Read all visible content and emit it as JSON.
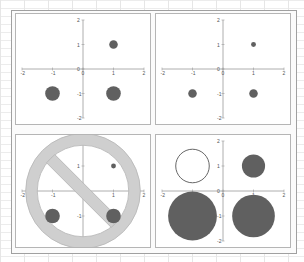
{
  "layout": {
    "rows": 2,
    "cols": 2
  },
  "colors": {
    "marker": "#606060",
    "axis": "#9a9a9a",
    "no_sign": "#cfcfcf",
    "no_sign_stroke": "#b5b5b5",
    "hollow_stroke": "#555555"
  },
  "chart_data": [
    {
      "type": "scatter",
      "title": "",
      "xlim": [
        -2,
        2
      ],
      "ylim": [
        -2,
        2
      ],
      "xticks": [
        "-2",
        "-1",
        "0",
        "1",
        "2"
      ],
      "yticks": [
        "2",
        "1",
        "0",
        "-1",
        "-2"
      ],
      "points": [
        {
          "x": 1,
          "y": 1,
          "size": 0.14,
          "fill": "solid"
        },
        {
          "x": -1,
          "y": -1,
          "size": 0.24,
          "fill": "solid"
        },
        {
          "x": 1,
          "y": -1,
          "size": 0.24,
          "fill": "solid"
        }
      ],
      "overlay": ""
    },
    {
      "type": "scatter",
      "title": "",
      "xlim": [
        -2,
        2
      ],
      "ylim": [
        -2,
        2
      ],
      "xticks": [
        "-2",
        "-1",
        "0",
        "1",
        "2"
      ],
      "yticks": [
        "2",
        "1",
        "0",
        "-1",
        "-2"
      ],
      "points": [
        {
          "x": 1,
          "y": 1,
          "size": 0.08,
          "fill": "solid"
        },
        {
          "x": -1,
          "y": -1,
          "size": 0.14,
          "fill": "solid"
        },
        {
          "x": 1,
          "y": -1,
          "size": 0.14,
          "fill": "solid"
        }
      ],
      "overlay": ""
    },
    {
      "type": "scatter",
      "title": "",
      "xlim": [
        -2,
        2
      ],
      "ylim": [
        -2,
        2
      ],
      "xticks": [
        "-2",
        "-1",
        "0",
        "1",
        "2"
      ],
      "yticks": [
        "2",
        "1",
        "0",
        "-1",
        "-2"
      ],
      "points": [
        {
          "x": 1,
          "y": 1,
          "size": 0.08,
          "fill": "solid"
        },
        {
          "x": -1,
          "y": -1,
          "size": 0.24,
          "fill": "solid"
        },
        {
          "x": 1,
          "y": -1,
          "size": 0.24,
          "fill": "solid"
        }
      ],
      "overlay": "prohibition-sign"
    },
    {
      "type": "scatter",
      "title": "",
      "xlim": [
        -2,
        2
      ],
      "ylim": [
        -2,
        2
      ],
      "xticks": [
        "-2",
        "-1",
        "0",
        "1",
        "2"
      ],
      "yticks": [
        "2",
        "1",
        "0",
        "-1",
        "-2"
      ],
      "points": [
        {
          "x": -1,
          "y": 1,
          "size": 0.55,
          "fill": "hollow"
        },
        {
          "x": 1,
          "y": 1,
          "size": 0.38,
          "fill": "solid"
        },
        {
          "x": -1,
          "y": -1,
          "size": 0.8,
          "fill": "solid"
        },
        {
          "x": 1,
          "y": -1,
          "size": 0.7,
          "fill": "solid"
        }
      ],
      "overlay": ""
    }
  ]
}
